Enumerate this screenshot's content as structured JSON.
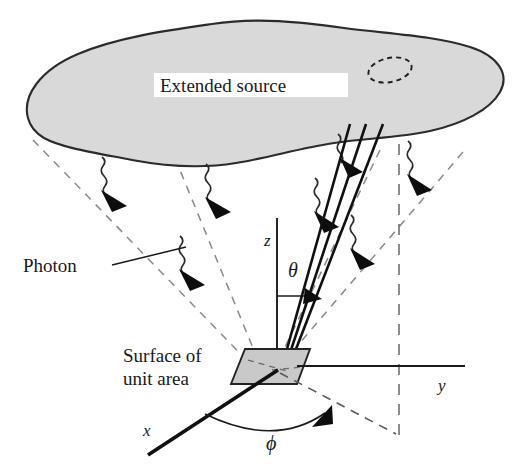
{
  "figure": {
    "background_color": "#ffffff"
  },
  "labels": {
    "extended_source": "Extended source",
    "photon": "Photon",
    "surface_line1": "Surface of",
    "surface_line2": "unit area",
    "axis_z": "z",
    "axis_y": "y",
    "axis_x": "x",
    "angle_theta": "θ",
    "angle_phi": "ϕ"
  },
  "colors": {
    "source_fill": "#d9d9d9",
    "source_outline": "#2b2b2b",
    "patch_fill": "#c9c9c9",
    "patch_outline": "#232323",
    "line": "#101010",
    "dashed": "#8a8a8a",
    "text": "#1a1a1a",
    "background": "#ffffff"
  },
  "elements": {
    "source_blob": "extended-source-blob",
    "solid_angle_ellipse": "dashed-solid-angle-ellipse",
    "unit_surface_patch": "unit-area-surface-patch",
    "beam_cone": "beam-cone-to-surface",
    "photon_count": 6,
    "axes": [
      "z",
      "y",
      "x"
    ],
    "angles": [
      "theta",
      "phi"
    ]
  }
}
